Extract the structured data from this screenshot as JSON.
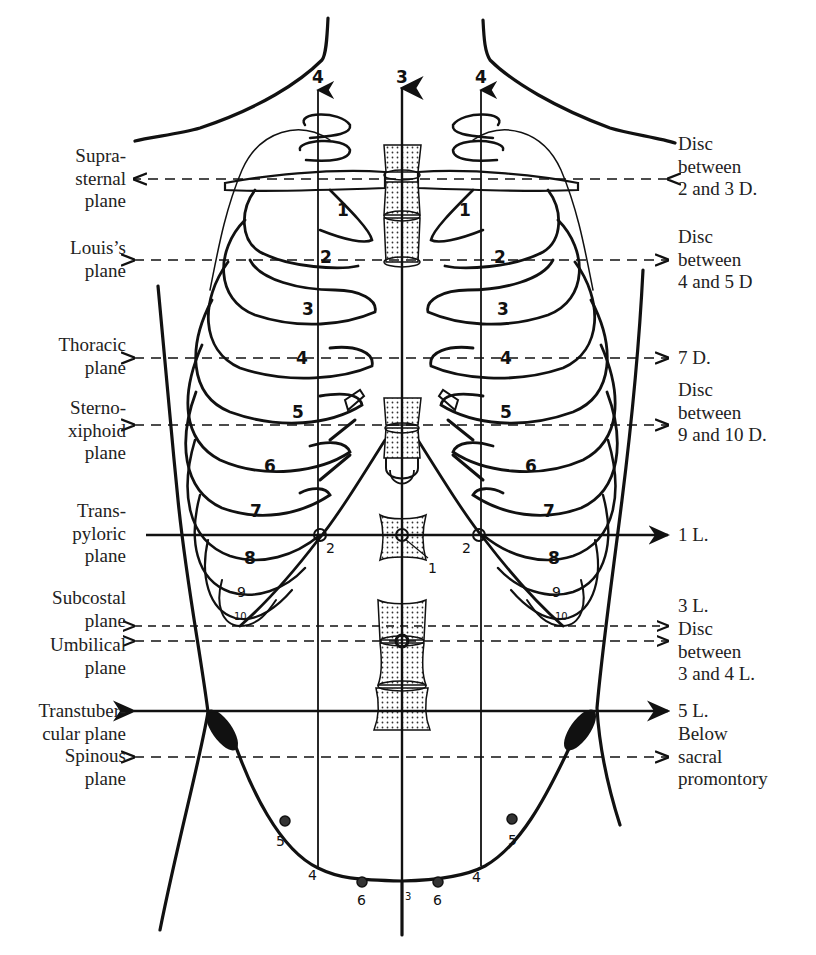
{
  "figure": {
    "vertical_lines": [
      {
        "id": "left-lateral",
        "label": "4",
        "x": 318
      },
      {
        "id": "median",
        "label": "3",
        "x": 402
      },
      {
        "id": "right-lateral",
        "label": "4",
        "x": 481
      }
    ],
    "rib_labels_left": [
      "1",
      "2",
      "3",
      "4",
      "5",
      "6",
      "7",
      "8",
      "9",
      "10"
    ],
    "rib_labels_right": [
      "1",
      "2",
      "3",
      "4",
      "5",
      "6",
      "7",
      "8",
      "9",
      "10"
    ],
    "point_labels": {
      "pyloric_left": "2",
      "pyloric_right": "2",
      "pylorus_center": "1",
      "pelvis_left_4": "4",
      "pelvis_right_4": "4",
      "pelvis_left_5": "5",
      "pelvis_right_5": "5",
      "pelvis_left_6": "6",
      "pelvis_right_6": "6",
      "pelvis_center_3": "3"
    }
  },
  "planes": [
    {
      "name": "suprasternal",
      "left_label": [
        "Supra-",
        "sternal",
        "plane"
      ],
      "right_label": [
        "Disc",
        "between",
        "2 and 3 D."
      ],
      "y": 179,
      "style": "dashed"
    },
    {
      "name": "louis",
      "left_label": [
        "Louis’s",
        "plane"
      ],
      "right_label": [
        "Disc",
        "between",
        "4 and 5 D"
      ],
      "y": 260,
      "style": "dashed"
    },
    {
      "name": "thoracic",
      "left_label": [
        "Thoracic",
        "plane"
      ],
      "right_label": [
        "7 D."
      ],
      "y": 358,
      "style": "dashed"
    },
    {
      "name": "sternoxiphoid",
      "left_label": [
        "Sterno-",
        "xiphoid",
        "plane"
      ],
      "right_label": [
        "Disc",
        "between",
        "9 and 10 D."
      ],
      "y": 425,
      "style": "dashed"
    },
    {
      "name": "transpyloric",
      "left_label": [
        "Trans-",
        "pyloric",
        "plane"
      ],
      "right_label": [
        "1 L."
      ],
      "y": 535,
      "style": "solid"
    },
    {
      "name": "subcostal",
      "left_label": [
        "Subcostal",
        "plane"
      ],
      "right_label": [
        "3 L."
      ],
      "y": 626,
      "style": "dashed"
    },
    {
      "name": "umbilical",
      "left_label": [
        "Umbilical",
        "plane"
      ],
      "right_label": [
        "Disc",
        "between",
        "3 and 4 L."
      ],
      "y": 641,
      "style": "dashed"
    },
    {
      "name": "transtubercular",
      "left_label": [
        "Transtuber-",
        "cular plane"
      ],
      "right_label": [
        "5 L."
      ],
      "y": 711,
      "style": "solid"
    },
    {
      "name": "spinous",
      "left_label": [
        "Spinous",
        "plane"
      ],
      "right_label": [
        "Below",
        "sacral",
        "promontory"
      ],
      "y": 757,
      "style": "dashed"
    }
  ],
  "colors": {
    "ink": "#111111",
    "paper": "#ffffff",
    "text": "#222222"
  }
}
